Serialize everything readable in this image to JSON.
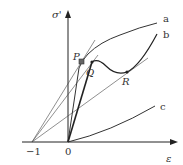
{
  "diagram": {
    "type": "stress-strain schematic",
    "axes": {
      "y_label": "σ'",
      "x_label": "ε",
      "x_ticks": [
        "−1",
        "0"
      ]
    },
    "curves": [
      {
        "id": "a",
        "label": "a"
      },
      {
        "id": "b",
        "label": "b"
      },
      {
        "id": "c",
        "label": "c"
      }
    ],
    "points": [
      {
        "id": "P",
        "label": "P"
      },
      {
        "id": "Q",
        "label": "Q"
      },
      {
        "id": "R",
        "label": "R"
      }
    ],
    "colors": {
      "line": "#333333",
      "background": "#ffffff"
    }
  }
}
